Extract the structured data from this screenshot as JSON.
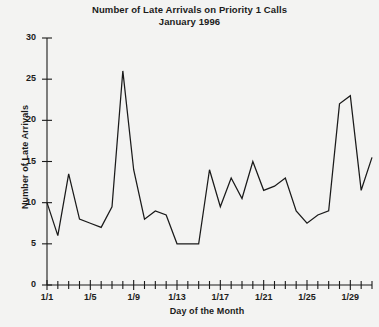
{
  "chart_data": {
    "type": "line",
    "title": "Number of Late Arrivals on Priority 1 Calls",
    "subtitle": "January 1996",
    "xlabel": "Day of the Month",
    "ylabel": "Number of Late Arrivals",
    "ylim": [
      0,
      30
    ],
    "y_ticks": [
      0,
      5,
      10,
      15,
      20,
      25,
      30
    ],
    "y_tick_labels": [
      "0",
      "5",
      "10",
      "15",
      "20",
      "25",
      "30"
    ],
    "xlim": [
      1,
      31
    ],
    "x_tick_labels": [
      "1/1",
      "1/5",
      "1/9",
      "1/13",
      "1/17",
      "1/21",
      "1/25",
      "1/29"
    ],
    "x_tick_days": [
      1,
      5,
      9,
      13,
      17,
      21,
      25,
      29
    ],
    "minor_x_ticks_every_day": true,
    "grid": false,
    "legend": "none",
    "line_color": "#1a1a1a",
    "background_color": "#f3f3f2",
    "x": [
      1,
      2,
      3,
      4,
      5,
      6,
      7,
      8,
      9,
      10,
      11,
      12,
      13,
      14,
      15,
      16,
      17,
      18,
      19,
      20,
      21,
      22,
      23,
      24,
      25,
      26,
      27,
      28,
      29,
      30,
      31
    ],
    "x_labels": [
      "1/1",
      "1/2",
      "1/3",
      "1/4",
      "1/5",
      "1/6",
      "1/7",
      "1/8",
      "1/9",
      "1/10",
      "1/11",
      "1/12",
      "1/13",
      "1/14",
      "1/15",
      "1/16",
      "1/17",
      "1/18",
      "1/19",
      "1/20",
      "1/21",
      "1/22",
      "1/23",
      "1/24",
      "1/25",
      "1/26",
      "1/27",
      "1/28",
      "1/29",
      "1/30",
      "1/31"
    ],
    "values": [
      10,
      6,
      13.5,
      8,
      7.5,
      7,
      9.5,
      26,
      14,
      8,
      9,
      8.5,
      5,
      5,
      5,
      14,
      9.5,
      13,
      10.5,
      15,
      11.5,
      12,
      13,
      9,
      7.5,
      8.5,
      9,
      22,
      23,
      11.5,
      15.5
    ],
    "series_name": "Late Arrivals"
  }
}
